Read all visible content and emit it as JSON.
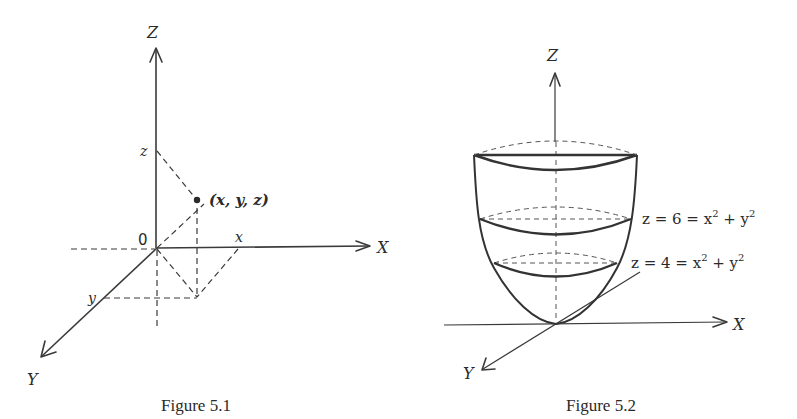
{
  "figure_5_1": {
    "caption": "Figure 5.1",
    "axes": {
      "z_label": "Z",
      "x_label": "X",
      "y_label": "Y",
      "origin_label": "0"
    },
    "ticks": {
      "x": "x",
      "y": "y",
      "z": "z"
    },
    "point_label": "(x, y, z)"
  },
  "figure_5_2": {
    "caption": "Figure 5.2",
    "axes": {
      "z_label": "Z",
      "x_label": "X",
      "y_label": "Y"
    },
    "level_curves": [
      {
        "z_value": "6",
        "label_prefix": "z = 6 = x",
        "exp1": "2",
        "mid": " + y",
        "exp2": "2"
      },
      {
        "z_value": "4",
        "label_prefix": "z = 4 = x",
        "exp1": "2",
        "mid": " + y",
        "exp2": "2"
      }
    ]
  },
  "colors": {
    "ink": "#2a2a2a",
    "background": "#ffffff"
  }
}
